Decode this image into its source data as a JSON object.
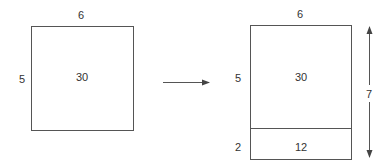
{
  "left_rect": {
    "width_label": "6",
    "height_label": "5",
    "area_label": "30"
  },
  "right_rect": {
    "width_label": "6",
    "top_height_label": "5",
    "top_area_label": "30",
    "bottom_height_label": "2",
    "bottom_area_label": "12",
    "total_height_label": "7"
  },
  "colors": {
    "line": "#555555",
    "text": "#333333"
  }
}
